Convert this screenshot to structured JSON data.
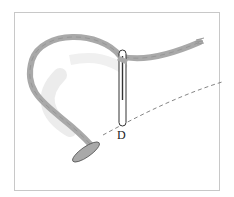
{
  "figure": {
    "label": "D",
    "colors": {
      "thread": "#a9a9a9",
      "thread_shadow": "#e6e6e6",
      "needle": "#ffffff",
      "outline": "#333333",
      "dashed_line": "#666666",
      "frame_border": "#c8c8c8"
    }
  }
}
